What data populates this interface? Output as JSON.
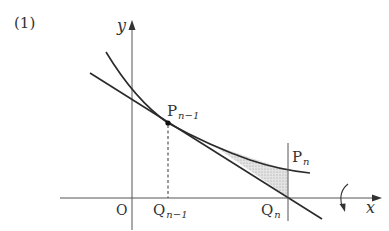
{
  "figure": {
    "number_label": "(1)",
    "axes": {
      "x_label": "x",
      "y_label": "y",
      "origin_label": "O"
    },
    "points": {
      "p_prev": {
        "base": "P",
        "sub": "n−1"
      },
      "p_n": {
        "base": "P",
        "sub": "n"
      },
      "q_prev": {
        "base": "Q",
        "sub": "n−1"
      },
      "q_n": {
        "base": "Q",
        "sub": "n"
      }
    },
    "elements": {
      "curve": "decreasing convex curve",
      "tangent_line": "tangent line at P_{n-1}",
      "shaded_region": "region between curve and tangent from tangent point to x = Q_n",
      "dashed_line": "vertical dashed segment from P_{n-1} to Q_{n-1}",
      "vertical_line": "vertical line x = Q_n",
      "rotation_arrow": "curved arrow indicating rotation about x-axis"
    },
    "colors": {
      "stroke": "#2a2a2a",
      "shade": "#d9d9d9",
      "axis": "#555555"
    }
  }
}
